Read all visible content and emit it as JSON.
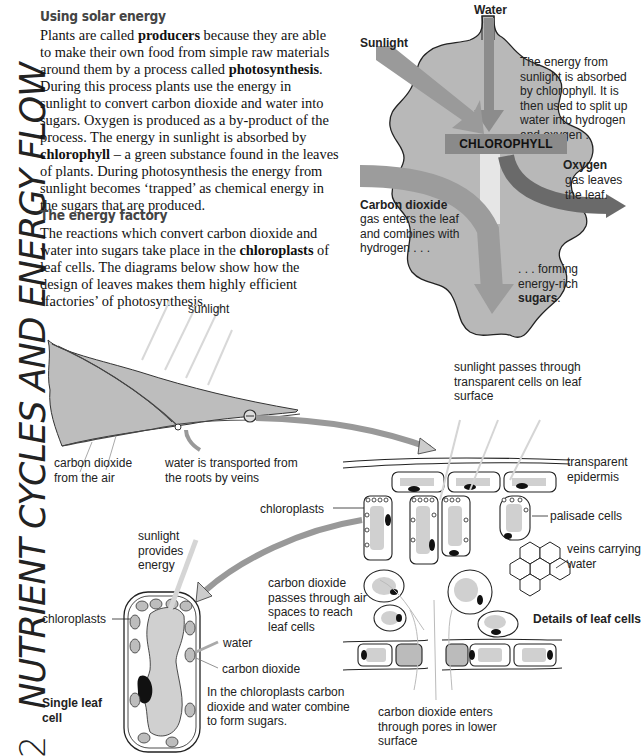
{
  "page": {
    "number": "2",
    "side_title": "NUTRIENT CYCLES AND ENERGY FLOW"
  },
  "section1": {
    "heading": "Using solar energy",
    "paragraph_parts": [
      "Plants are called ",
      "producers",
      " because they are able to make their own food from simple raw materials around them by a process called ",
      "photosynthesis",
      ". During this process plants use the energy in sunlight to convert carbon dioxide and water into sugars. Oxygen is produced as a by-product of the process. The energy in sunlight is absorbed by ",
      "chlorophyll",
      " – a green substance found in the leaves of plants. During photosynthesis the energy from sunlight becomes ‘trapped’ as chemical energy in the sugars that are produced."
    ]
  },
  "section2": {
    "heading": "The energy factory",
    "paragraph_parts": [
      "The reactions which convert carbon dioxide and water into sugars take place in the ",
      "chloroplasts",
      " of leaf cells. The diagrams below show how the design of leaves makes them highly efficient ‘factories’ of photosynthesis."
    ]
  },
  "leaf_diagram": {
    "water_label": "Water",
    "sunlight_label": "Sunlight",
    "chlorophyll_label": "CHLOROPHYLL",
    "energy_note": "The energy from sunlight is absorbed by chlorophyll. It is then used to split up water into hydrogen and oxygen .",
    "oxygen_title": "Oxygen",
    "oxygen_note": "gas leaves the leaf.",
    "co2_title": "Carbon dioxide",
    "co2_note": "gas enters the leaf and combines with hydrogen . . .",
    "forming_note": ". . . forming energy-rich",
    "sugars_label": "sugars",
    "sugars_period": "."
  },
  "leaf_section": {
    "sunlight": "sunlight",
    "co2_from_air": "carbon dioxide from the air",
    "water_transport": "water is transported from the roots by veins"
  },
  "cell_details": {
    "sunlight_passes": "sunlight passes through transparent cells on leaf surface",
    "transparent_epidermis": "transparent epidermis",
    "palisade_cells": "palisade cells",
    "veins_carrying": "veins carrying water",
    "chloroplasts": "chloroplasts",
    "co2_air_spaces": "carbon dioxide passes through air spaces to reach leaf cells",
    "title": "Details of leaf cells",
    "co2_pores": "carbon dioxide enters through pores in lower surface"
  },
  "single_cell": {
    "sunlight_provides": "sunlight provides energy",
    "chloroplasts": "chloroplasts",
    "water": "water",
    "carbon_dioxide": "carbon dioxide",
    "combine_note": "In the chloroplasts carbon dioxide and water combine to form sugars.",
    "title": "Single leaf cell"
  },
  "colors": {
    "leaf_fill": "#b9b9b9",
    "arrow_gray": "#8c8c8c",
    "oxygen_arrow": "#6a6a6a",
    "chlorophyll_box": "#8a8a8a",
    "cell_fill": "#d2d2d2",
    "nucleus": "#111111"
  }
}
